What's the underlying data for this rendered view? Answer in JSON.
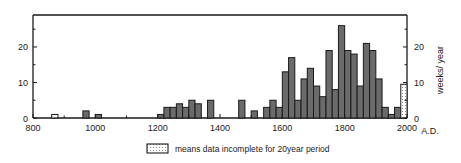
{
  "chart_data": {
    "type": "bar",
    "title": "",
    "subtitle": "",
    "xlabel": "A.D.",
    "ylabel": "",
    "ylabel_right": "weeks/ year",
    "xlim": [
      800,
      2000
    ],
    "ylim": [
      0,
      29
    ],
    "bin_width": 20,
    "grid": false,
    "legend_position": "below-axes",
    "x_ticks_major": [
      800,
      1000,
      1200,
      1400,
      1600,
      1800,
      2000
    ],
    "x_ticks_minor": [
      900,
      1100,
      1300,
      1500,
      1700,
      1900
    ],
    "x_tick_labels": [
      "800",
      "1000",
      "1200",
      "1400",
      "1600",
      "1800",
      "2000"
    ],
    "y_ticks_major": [
      0,
      10,
      20
    ],
    "y_ticks_minor": [
      5,
      15,
      25
    ],
    "y_tick_labels": [
      "0",
      "10",
      "20"
    ],
    "y_ticks_right_major": [
      0,
      10,
      20
    ],
    "y_ticks_right_minor": [
      5,
      15,
      25
    ],
    "y_tick_labels_right": [
      "0",
      "10",
      "20"
    ],
    "x_axis_suffix": "A.D.",
    "series": [
      {
        "name": "complete data",
        "fill": "#6b6b6b",
        "bins": [
          {
            "x": 860,
            "value": 1,
            "incomplete": true
          },
          {
            "x": 960,
            "value": 2,
            "incomplete": false
          },
          {
            "x": 1000,
            "value": 1,
            "incomplete": false
          },
          {
            "x": 1200,
            "value": 1,
            "incomplete": false
          },
          {
            "x": 1220,
            "value": 3,
            "incomplete": false
          },
          {
            "x": 1240,
            "value": 3,
            "incomplete": false
          },
          {
            "x": 1260,
            "value": 4,
            "incomplete": false
          },
          {
            "x": 1280,
            "value": 3,
            "incomplete": false
          },
          {
            "x": 1300,
            "value": 5,
            "incomplete": false
          },
          {
            "x": 1320,
            "value": 4,
            "incomplete": false
          },
          {
            "x": 1360,
            "value": 5,
            "incomplete": false
          },
          {
            "x": 1460,
            "value": 5,
            "incomplete": false
          },
          {
            "x": 1500,
            "value": 2,
            "incomplete": false
          },
          {
            "x": 1540,
            "value": 3,
            "incomplete": false
          },
          {
            "x": 1560,
            "value": 5,
            "incomplete": false
          },
          {
            "x": 1580,
            "value": 3,
            "incomplete": false
          },
          {
            "x": 1600,
            "value": 13,
            "incomplete": false
          },
          {
            "x": 1620,
            "value": 17,
            "incomplete": false
          },
          {
            "x": 1640,
            "value": 5,
            "incomplete": false
          },
          {
            "x": 1660,
            "value": 11,
            "incomplete": false
          },
          {
            "x": 1680,
            "value": 14,
            "incomplete": false
          },
          {
            "x": 1700,
            "value": 9,
            "incomplete": false
          },
          {
            "x": 1720,
            "value": 6,
            "incomplete": false
          },
          {
            "x": 1740,
            "value": 19,
            "incomplete": false
          },
          {
            "x": 1760,
            "value": 8,
            "incomplete": false
          },
          {
            "x": 1780,
            "value": 26,
            "incomplete": false
          },
          {
            "x": 1800,
            "value": 19,
            "incomplete": false
          },
          {
            "x": 1820,
            "value": 18,
            "incomplete": false
          },
          {
            "x": 1840,
            "value": 9,
            "incomplete": false
          },
          {
            "x": 1860,
            "value": 21,
            "incomplete": false
          },
          {
            "x": 1880,
            "value": 19,
            "incomplete": false
          },
          {
            "x": 1900,
            "value": 11,
            "incomplete": false
          },
          {
            "x": 1920,
            "value": 3,
            "incomplete": false
          },
          {
            "x": 1940,
            "value": 1,
            "incomplete": false
          },
          {
            "x": 1960,
            "value": 3,
            "incomplete": false
          },
          {
            "x": 1980,
            "value": 9.5,
            "incomplete": true
          }
        ]
      }
    ],
    "legend": {
      "swatch_style": "dotted-white-box",
      "label": "means data incomplete for 20year period"
    },
    "colors": {
      "bar_fill": "#6b6b6b",
      "bar_edge": "#1a1a1a",
      "incomplete_fill": "#ffffff",
      "axis": "#1a1a1a",
      "background": "#ffffff"
    }
  }
}
